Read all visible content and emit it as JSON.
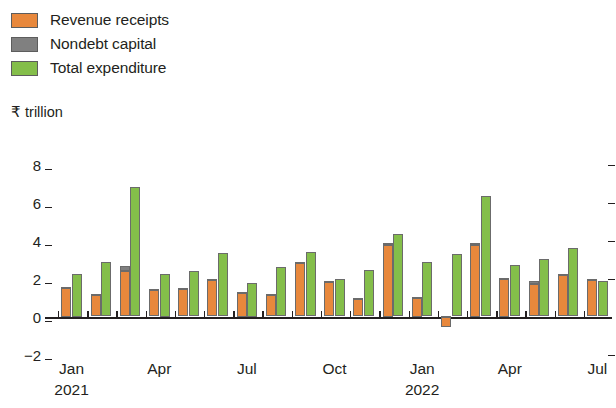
{
  "legend": {
    "items": [
      {
        "label": "Revenue receipts",
        "color": "#e8883c",
        "swatch": "legend-swatch-revenue"
      },
      {
        "label": "Nondebt capital",
        "color": "#808080",
        "swatch": "legend-swatch-nondebt"
      },
      {
        "label": "Total expenditure",
        "color": "#84be4a",
        "swatch": "legend-swatch-expenditure"
      }
    ]
  },
  "axis": {
    "unit_label": "₹ trillion",
    "y_ticks": [
      "8",
      "6",
      "4",
      "2",
      "0",
      "−2"
    ],
    "x_tick_labels": [
      "Jan",
      "Apr",
      "Jul",
      "Oct",
      "Jan",
      "Apr",
      "Jul"
    ],
    "x_year_labels": [
      {
        "index": 0,
        "text": "2021"
      },
      {
        "index": 4,
        "text": "2022"
      }
    ]
  },
  "chart_data": {
    "type": "bar",
    "title": "",
    "subtitle": "",
    "xlabel": "",
    "ylabel": "₹ trillion",
    "ylim": [
      -2,
      8
    ],
    "ytick_values": [
      8,
      6,
      4,
      2,
      0,
      -2
    ],
    "grid": false,
    "legend_position": "top-left",
    "bar_mode": "revenue+nondebt stacked, expenditure separate",
    "categories": [
      "Jan 2021",
      "Feb 2021",
      "Mar 2021",
      "Apr 2021",
      "May 2021",
      "Jun 2021",
      "Jul 2021",
      "Aug 2021",
      "Sep 2021",
      "Oct 2021",
      "Nov 2021",
      "Dec 2021",
      "Jan 2022",
      "Feb 2022",
      "Mar 2022",
      "Apr 2022",
      "May 2022",
      "Jun 2022",
      "Jul 2022"
    ],
    "category_ticks": [
      "Jan",
      "Feb",
      "Mar",
      "Apr",
      "May",
      "Jun",
      "Jul",
      "Aug",
      "Sep",
      "Oct",
      "Nov",
      "Dec",
      "Jan",
      "Feb",
      "Mar",
      "Apr",
      "May",
      "Jun",
      "Jul"
    ],
    "series": [
      {
        "name": "Revenue receipts",
        "color": "#e8883c",
        "values": [
          1.5,
          1.15,
          2.4,
          1.4,
          1.45,
          1.9,
          1.25,
          1.15,
          2.8,
          1.8,
          0.95,
          3.75,
          1.0,
          -0.55,
          3.75,
          2.0,
          1.7,
          2.2,
          1.9
        ]
      },
      {
        "name": "Nondebt capital",
        "color": "#808080",
        "values": [
          0.05,
          0.05,
          0.25,
          0.05,
          0.05,
          0.05,
          0.05,
          0.05,
          0.05,
          0.05,
          0.05,
          0.1,
          0.05,
          0.05,
          0.1,
          0.05,
          0.15,
          0.05,
          0.05
        ]
      },
      {
        "name": "Total expenditure",
        "color": "#84be4a",
        "values": [
          2.25,
          2.85,
          6.8,
          2.25,
          2.4,
          3.35,
          1.75,
          2.6,
          3.4,
          1.95,
          2.45,
          4.35,
          2.85,
          3.3,
          6.35,
          2.7,
          3.05,
          3.6,
          1.85
        ]
      }
    ]
  }
}
